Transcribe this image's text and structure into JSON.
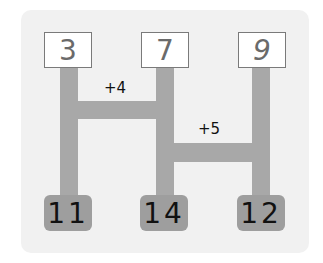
{
  "diagram": {
    "type": "ladder-addition",
    "top_numbers": [
      "3",
      "7",
      "9"
    ],
    "bottom_numbers": [
      "11",
      "14",
      "12"
    ],
    "operations": [
      {
        "label": "+4",
        "connects": [
          "col1",
          "col2"
        ]
      },
      {
        "label": "+5",
        "connects": [
          "col2",
          "col3"
        ]
      }
    ]
  },
  "colors": {
    "card": "#f1f1f1",
    "bar": "#a8a8a8",
    "bottom_box": "#9e9e9e",
    "top_box": "#ffffff"
  }
}
